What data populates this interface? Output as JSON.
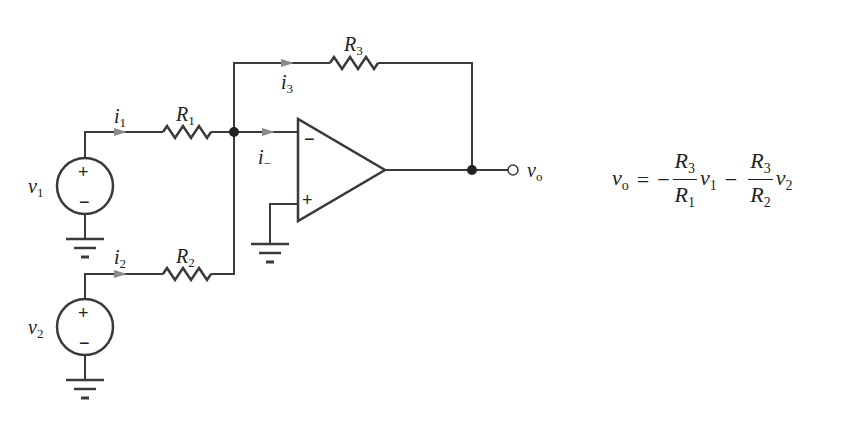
{
  "diagram": {
    "type": "circuit",
    "components": {
      "sources": [
        {
          "id": "v1",
          "label": "v",
          "sub": "1",
          "plus": "+",
          "minus": "−"
        },
        {
          "id": "v2",
          "label": "v",
          "sub": "2",
          "plus": "+",
          "minus": "−"
        }
      ],
      "resistors": [
        {
          "id": "R1",
          "label": "R",
          "sub": "1"
        },
        {
          "id": "R2",
          "label": "R",
          "sub": "2"
        },
        {
          "id": "R3",
          "label": "R",
          "sub": "3"
        }
      ],
      "currents": [
        {
          "id": "i1",
          "label": "i",
          "sub": "1"
        },
        {
          "id": "i2",
          "label": "i",
          "sub": "2"
        },
        {
          "id": "i3",
          "label": "i",
          "sub": "3"
        },
        {
          "id": "i_minus",
          "label": "i",
          "sub": "−"
        }
      ],
      "opamp": {
        "inverting": "−",
        "noninverting": "+"
      },
      "output": {
        "label": "v",
        "sub": "o"
      }
    },
    "equation": {
      "lhs": {
        "v": "v",
        "sub": "o"
      },
      "equals": "=",
      "term1": {
        "sign": "−",
        "num": "R",
        "num_sub": "3",
        "den": "R",
        "den_sub": "1",
        "var": "v",
        "var_sub": "1"
      },
      "term2": {
        "sign": "−",
        "num": "R",
        "num_sub": "3",
        "den": "R",
        "den_sub": "2",
        "var": "v",
        "var_sub": "2"
      }
    },
    "colors": {
      "wire": "#3a3a3a",
      "arrow": "#8a8a8a",
      "text": "#222222",
      "background": "#ffffff"
    }
  }
}
